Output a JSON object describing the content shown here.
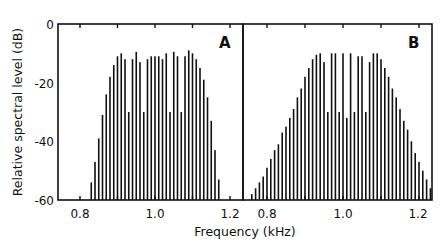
{
  "chart_data": [
    {
      "panel": "A",
      "type": "bar",
      "xlabel": "Frequency (kHz)",
      "ylabel": "Relative spectral level (dB)",
      "xlim": [
        0.74,
        1.235
      ],
      "ylim": [
        -60,
        0
      ],
      "xticks": [
        0.8,
        1.0,
        1.2
      ],
      "yticks": [
        0,
        -20,
        -40,
        -60
      ],
      "x": [
        0.83,
        0.84,
        0.85,
        0.86,
        0.87,
        0.88,
        0.89,
        0.9,
        0.91,
        0.92,
        0.93,
        0.94,
        0.95,
        0.96,
        0.97,
        0.98,
        0.99,
        1.0,
        1.01,
        1.02,
        1.03,
        1.04,
        1.05,
        1.06,
        1.07,
        1.08,
        1.09,
        1.1,
        1.11,
        1.12,
        1.13,
        1.14,
        1.15,
        1.16,
        1.17
      ],
      "values": [
        -54,
        -47,
        -39,
        -31,
        -24,
        -18,
        -14,
        -11,
        -10,
        -12,
        -30,
        -12,
        -9.5,
        -13,
        -30,
        -12,
        -11,
        -11,
        -11,
        -12,
        -10,
        -30,
        -9.5,
        -11,
        -30,
        -11,
        -9,
        -10,
        -12,
        -15,
        -19,
        -25,
        -33,
        -43,
        -53
      ]
    },
    {
      "panel": "B",
      "type": "bar",
      "xlabel": "Frequency (kHz)",
      "ylabel": "Relative spectral level (dB)",
      "xlim": [
        0.74,
        1.235
      ],
      "ylim": [
        -60,
        0
      ],
      "xticks": [
        0.8,
        1.0,
        1.2
      ],
      "yticks": [
        0,
        -20,
        -40,
        -60
      ],
      "x": [
        0.76,
        0.77,
        0.78,
        0.79,
        0.8,
        0.81,
        0.82,
        0.83,
        0.84,
        0.85,
        0.86,
        0.87,
        0.88,
        0.89,
        0.9,
        0.91,
        0.92,
        0.93,
        0.94,
        0.95,
        0.96,
        0.97,
        0.98,
        0.99,
        1.0,
        1.01,
        1.02,
        1.03,
        1.04,
        1.05,
        1.06,
        1.07,
        1.08,
        1.09,
        1.1,
        1.11,
        1.12,
        1.13,
        1.14,
        1.15,
        1.16,
        1.17,
        1.18,
        1.19,
        1.2,
        1.21,
        1.22,
        1.23
      ],
      "values": [
        -58,
        -56,
        -54,
        -52,
        -49,
        -46,
        -43,
        -41,
        -37,
        -35,
        -32,
        -29,
        -25,
        -22,
        -18,
        -15,
        -12,
        -10.5,
        -10,
        -13,
        -30,
        -10,
        -10,
        -30,
        -10,
        -32,
        -10,
        -30,
        -11,
        -11,
        -30,
        -13,
        -10,
        -10,
        -12,
        -15,
        -18,
        -22,
        -25,
        -29,
        -33,
        -36,
        -40,
        -44,
        -47,
        -50,
        -53,
        -56
      ]
    }
  ],
  "figure": {
    "ylabel": "Relative spectral level (dB)",
    "xlabel": "Frequency (kHz)",
    "panels": [
      {
        "label": "A",
        "xticks": [
          "0.8",
          "1.0",
          "1.2"
        ]
      },
      {
        "label": "B",
        "xticks": [
          "0.8",
          "1.0",
          "1.2"
        ]
      }
    ],
    "yticks": [
      "0",
      "-20",
      "-40",
      "-60"
    ]
  }
}
